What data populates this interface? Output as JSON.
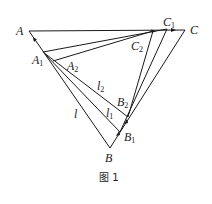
{
  "figure": {
    "caption": "图 1",
    "points": {
      "A": {
        "label": "A",
        "sub": "",
        "x": 29,
        "y": 31
      },
      "C": {
        "label": "C",
        "sub": "",
        "x": 185,
        "y": 30
      },
      "C1": {
        "label": "C",
        "sub": "1",
        "x": 167,
        "y": 29
      },
      "C2": {
        "label": "C",
        "sub": "2",
        "x": 153,
        "y": 31
      },
      "A1": {
        "label": "A",
        "sub": "1",
        "x": 43,
        "y": 52
      },
      "A2": {
        "label": "A",
        "sub": "2",
        "x": 53,
        "y": 61
      },
      "B": {
        "label": "B",
        "sub": "",
        "x": 110,
        "y": 148
      },
      "B1": {
        "label": "B",
        "sub": "1",
        "x": 120,
        "y": 132
      },
      "B2": {
        "label": "B",
        "sub": "2",
        "x": 128,
        "y": 117
      }
    },
    "line_labels": {
      "l": {
        "label": "l",
        "sub": ""
      },
      "l1": {
        "label": "l",
        "sub": "1"
      },
      "l2": {
        "label": "l",
        "sub": "2"
      }
    },
    "stroke_color": "#1a1a1a"
  }
}
